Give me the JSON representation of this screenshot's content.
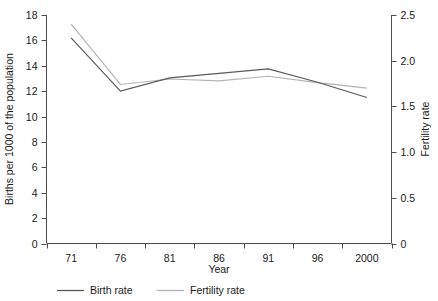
{
  "chart_data": {
    "type": "line",
    "title": "",
    "xlabel": "Year",
    "ylabel": "Births per 1000 of the population",
    "y2label": "Fertility rate",
    "categories": [
      "71",
      "76",
      "81",
      "86",
      "91",
      "96",
      "2000"
    ],
    "x_tick_labels": [
      "71",
      "76",
      "81",
      "86",
      "91",
      "96",
      "2000"
    ],
    "y_tick_labels": [
      "0",
      "2",
      "4",
      "6",
      "8",
      "10",
      "12",
      "14",
      "16",
      "18"
    ],
    "y_tick_values": [
      0,
      2,
      4,
      6,
      8,
      10,
      12,
      14,
      16,
      18
    ],
    "y2_tick_labels": [
      "0",
      "0.5",
      "1.0",
      "1.5",
      "2.0",
      "2.5"
    ],
    "y2_tick_values": [
      0,
      0.5,
      1.0,
      1.5,
      2.0,
      2.5
    ],
    "ylim": [
      0,
      18
    ],
    "y2lim": [
      0,
      2.5
    ],
    "grid": false,
    "legend_position": "bottom-left",
    "series": [
      {
        "name": "Birth rate",
        "axis": "left",
        "color": "#595959",
        "values": [
          16.2,
          12.0,
          13.05,
          13.4,
          13.75,
          12.7,
          11.5
        ]
      },
      {
        "name": "Fertility rate",
        "axis": "right",
        "color": "#b3b3b3",
        "values": [
          2.4,
          1.74,
          1.8,
          1.78,
          1.83,
          1.76,
          1.7
        ]
      }
    ]
  },
  "legend": {
    "items": [
      {
        "label": "Birth rate",
        "color": "#595959"
      },
      {
        "label": "Fertility rate",
        "color": "#b3b3b3"
      }
    ]
  },
  "colors": {
    "birth_rate": "#595959",
    "fertility_rate": "#b3b3b3",
    "axis": "#4d4d4d",
    "text": "#1a1a1a",
    "background": "#ffffff"
  }
}
